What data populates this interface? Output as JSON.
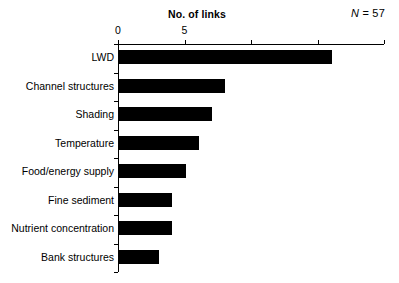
{
  "chart_data": {
    "type": "bar",
    "orientation": "horizontal",
    "title": "No. of links",
    "xlabel": "",
    "ylabel": "",
    "xlim": [
      0,
      20
    ],
    "ylim": [
      0,
      8
    ],
    "grid": false,
    "legend": null,
    "annotation": "N = 57",
    "annotation_parts": {
      "symbol": "N",
      "equals_value": " = 57"
    },
    "xticks": [
      0,
      5,
      10,
      15,
      20
    ],
    "xticklabels": [
      "0",
      "5",
      "",
      "",
      ""
    ],
    "bar_color": "#000000",
    "background_color": "#ffffff",
    "axis_color": "#000000",
    "categories": [
      "LWD",
      "Channel structures",
      "Shading",
      "Temperature",
      "Food/energy supply",
      "Fine sediment",
      "Nutrient concentration",
      "Bank structures"
    ],
    "values": [
      16,
      8,
      7,
      6,
      5,
      4,
      4,
      3
    ]
  }
}
